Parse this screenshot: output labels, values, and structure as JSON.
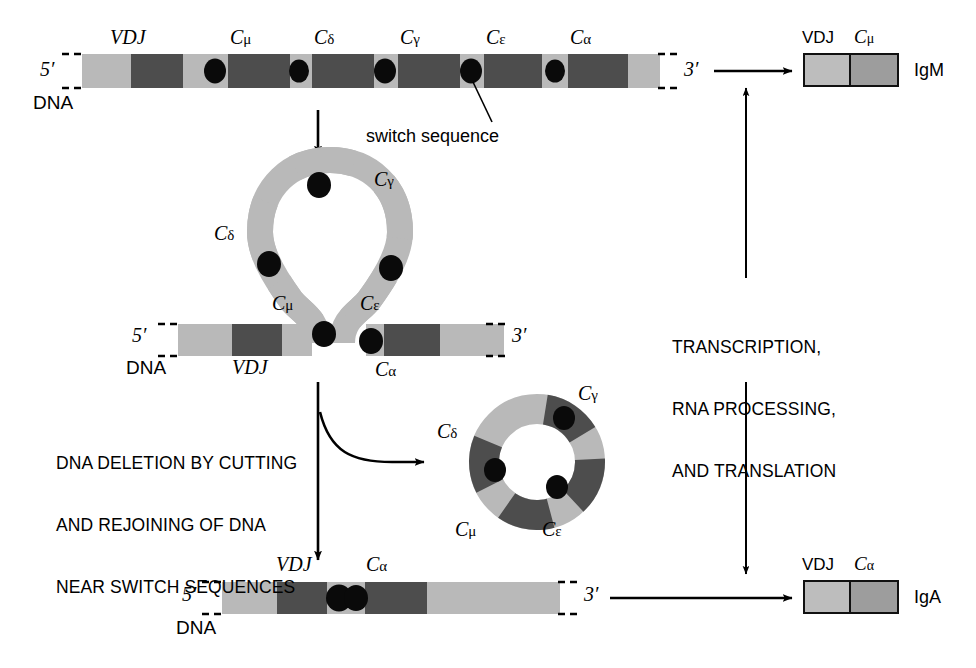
{
  "figure": {
    "width": 976,
    "height": 668
  },
  "colors": {
    "light_gray": "#b9b9b9",
    "mid_gray": "#9a9a9a",
    "dark_gray": "#4d4d4d",
    "switch_dot": "#0a0a0a",
    "line": "#000000",
    "background": "#ffffff",
    "product_vdj": "#bdbdbd",
    "product_c": "#9d9d9d"
  },
  "germline": {
    "five_prime": "5′",
    "three_prime": "3′",
    "dna_label": "DNA",
    "switch_callout": "switch sequence",
    "segments": [
      {
        "name": "VDJ",
        "label": "VDJ",
        "italic": true
      },
      {
        "name": "C-mu",
        "label": "C",
        "sub": "μ"
      },
      {
        "name": "C-delta",
        "label": "C",
        "sub": "δ"
      },
      {
        "name": "C-gamma",
        "label": "C",
        "sub": "γ"
      },
      {
        "name": "C-epsilon",
        "label": "C",
        "sub": "ε"
      },
      {
        "name": "C-alpha",
        "label": "C",
        "sub": "α"
      }
    ]
  },
  "looped": {
    "five_prime": "5′",
    "three_prime": "3′",
    "dna_label": "DNA",
    "labels": {
      "vdj": "VDJ",
      "c_mu": "C",
      "c_mu_sub": "μ",
      "c_delta": "C",
      "c_delta_sub": "δ",
      "c_gamma": "C",
      "c_gamma_sub": "γ",
      "c_epsilon": "C",
      "c_epsilon_sub": "ε",
      "c_alpha": "C",
      "c_alpha_sub": "α"
    }
  },
  "excised_circle": {
    "labels": {
      "c_gamma": "C",
      "c_gamma_sub": "γ",
      "c_delta": "C",
      "c_delta_sub": "δ",
      "c_mu": "C",
      "c_mu_sub": "μ",
      "c_epsilon": "C",
      "c_epsilon_sub": "ε"
    }
  },
  "switched": {
    "five_prime": "5′",
    "three_prime": "3′",
    "dna_label": "DNA",
    "labels": {
      "vdj": "VDJ",
      "c_alpha": "C",
      "c_alpha_sub": "α"
    }
  },
  "annotations": {
    "deletion_line1": "DNA DELETION BY CUTTING",
    "deletion_line2": "AND REJOINING OF DNA",
    "deletion_line3": "NEAR SWITCH SEQUENCES",
    "transcription_line1": "TRANSCRIPTION,",
    "transcription_line2": "RNA PROCESSING,",
    "transcription_line3": "AND TRANSLATION"
  },
  "products": [
    {
      "name": "igm-product",
      "header_vdj": "VDJ",
      "header_c": "C",
      "header_c_sub": "μ",
      "label": "IgM"
    },
    {
      "name": "iga-product",
      "header_vdj": "VDJ",
      "header_c": "C",
      "header_c_sub": "α",
      "label": "IgA"
    }
  ]
}
